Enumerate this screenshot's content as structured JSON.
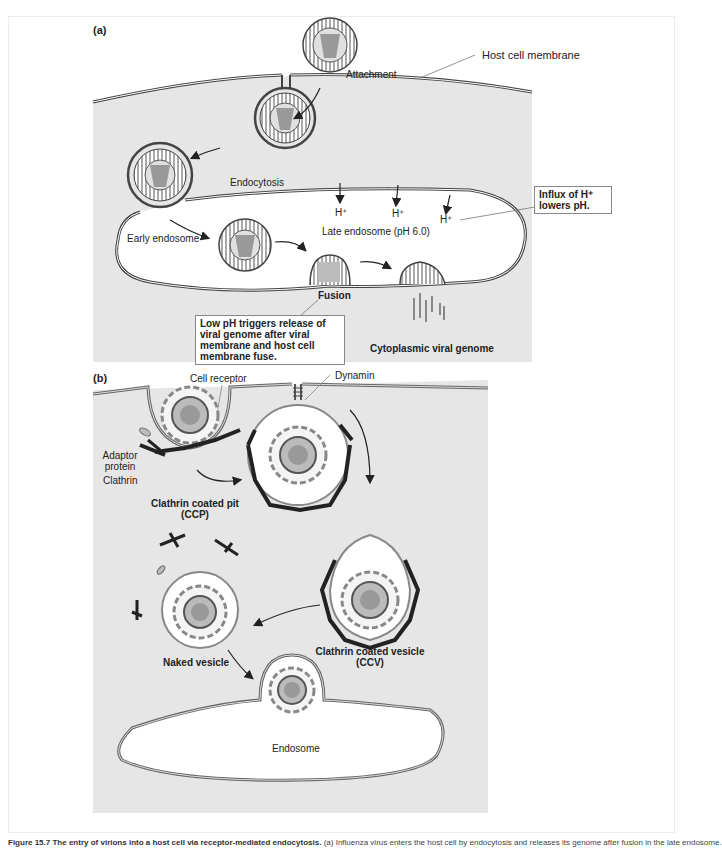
{
  "figure": {
    "caption_title": "Figure 15.7 The entry of virions into a host cell via receptor-mediated endocytosis.",
    "caption_text": "(a) Influenza virus enters the host cell by endocytosis and releases its genome after fusion in the late endosome."
  },
  "panel_a": {
    "label": "(a)",
    "background": "#e6e6e6",
    "labels": {
      "attachment": "Attachment",
      "host_cell_membrane": "Host cell membrane",
      "endocytosis": "Endocytosis",
      "early_endosome": "Early endosome",
      "late_endosome": "Late endosome (pH 6.0)",
      "h_plus_1": "H⁺",
      "h_plus_2": "H⁺",
      "h_plus_3": "H⁺",
      "fusion": "Fusion",
      "cytoplasmic_viral_genome": "Cytoplasmic viral genome"
    },
    "callouts": {
      "influx": "Influx of H⁺ lowers pH.",
      "low_ph": "Low pH triggers release of viral genome after viral membrane and host cell membrane fuse."
    }
  },
  "panel_b": {
    "label": "(b)",
    "background": "#e6e6e6",
    "labels": {
      "cell_receptor": "Cell receptor",
      "dynamin": "Dynamin",
      "adaptor_protein": "Adaptor protein",
      "clathrin": "Clathrin",
      "ccp": "Clathrin coated pit (CCP)",
      "ccv": "Clathrin coated vesicle (CCV)",
      "naked_vesicle": "Naked vesicle",
      "endosome": "Endosome"
    }
  },
  "colors": {
    "membrane": "#444444",
    "clathrin": "#222222",
    "capsid_gray": "#9a9a9a",
    "panel_bg": "#e6e6e6"
  }
}
